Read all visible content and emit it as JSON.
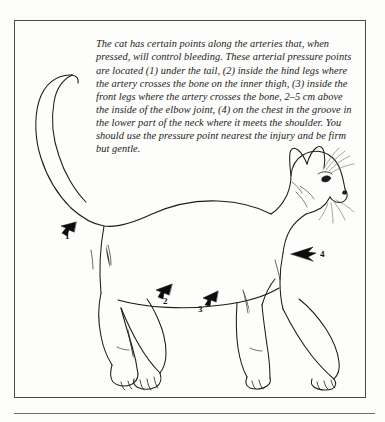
{
  "figure": {
    "caption": "The cat has certain points along the arteries that, when pressed, will control bleeding. These arterial pressure points are located (1) under the tail, (2) inside the hind legs where the artery crosses the bone on the inner thigh, (3) inside the front legs where the artery crosses the bone, 2–5 cm above the inside of the elbow joint, (4) on the chest in the groove in the lower part of the neck where it meets the shoulder. You should use the pressure point nearest the injury and be firm but gentle.",
    "illustration_name": "cat-pressure-points-diagram",
    "illustration_subject": "cat standing in profile facing right",
    "ink_color": "#1b1b1b",
    "frame_color": "#4a4a4a",
    "background_color": "#fdfdfc"
  },
  "markers": [
    {
      "id": "1",
      "label": "1",
      "location": "under the tail"
    },
    {
      "id": "2",
      "label": "2",
      "location": "inside the hind legs"
    },
    {
      "id": "3",
      "label": "3",
      "location": "inside the front legs"
    },
    {
      "id": "4",
      "label": "4",
      "location": "on the chest at the neck groove"
    }
  ]
}
